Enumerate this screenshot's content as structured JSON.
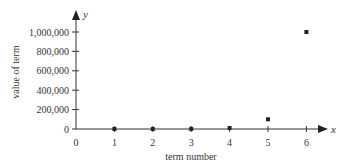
{
  "chart_data": {
    "type": "scatter",
    "title": "",
    "xlabel": "term number",
    "ylabel": "value of term",
    "x_axis_letter": "x",
    "y_axis_letter": "y",
    "xlim": [
      0,
      6
    ],
    "ylim": [
      0,
      1000000
    ],
    "x_ticks": [
      "0",
      "1",
      "2",
      "3",
      "4",
      "5",
      "6"
    ],
    "y_ticks": [
      "0",
      "200,000",
      "400,000",
      "600,000",
      "800,000",
      "1,000,000"
    ],
    "grid": false,
    "legend": null,
    "points": [
      {
        "x": 1,
        "y": 10
      },
      {
        "x": 2,
        "y": 100
      },
      {
        "x": 3,
        "y": 1000
      },
      {
        "x": 4,
        "y": 10000
      },
      {
        "x": 5,
        "y": 100000
      },
      {
        "x": 6,
        "y": 1000000
      }
    ],
    "colors": {
      "axis": "#333333",
      "marker": "#222222"
    }
  }
}
